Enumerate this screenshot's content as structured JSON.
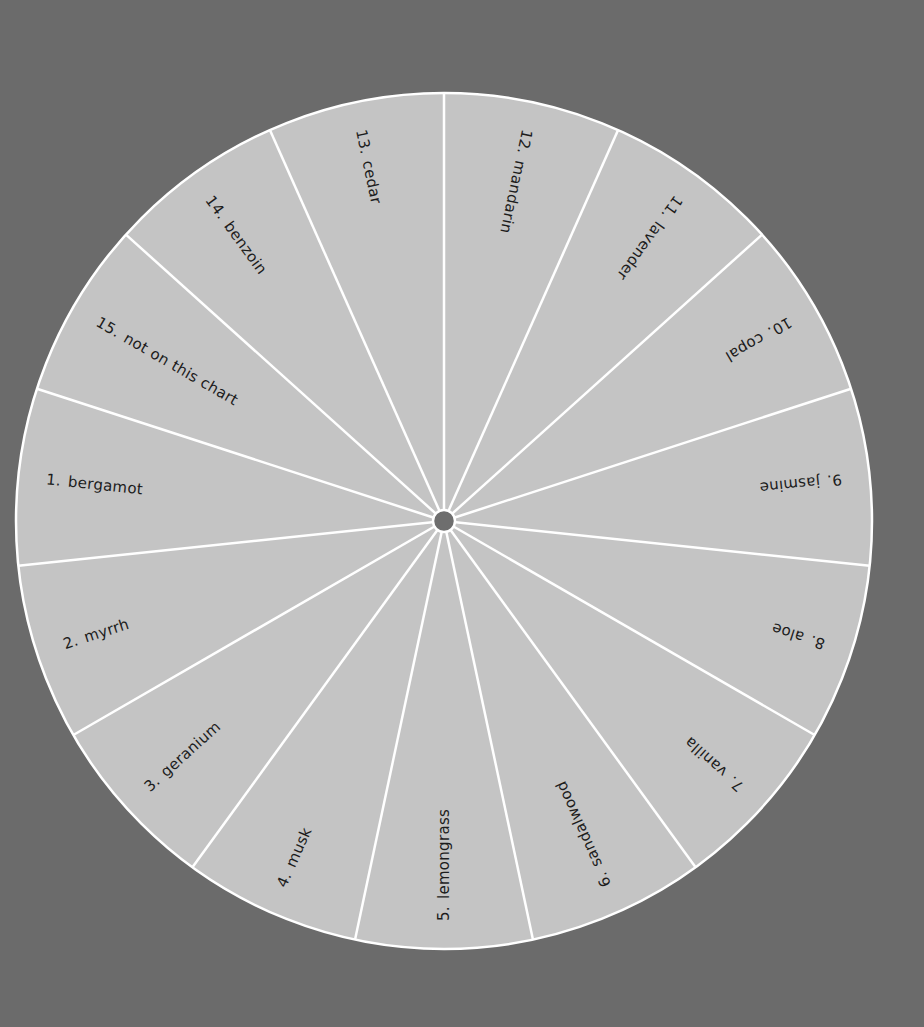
{
  "wheel": {
    "center": [
      444,
      521
    ],
    "radius": 428,
    "hub_radius": 11,
    "start_angle_deg": -90,
    "segment_count": 15,
    "label_radius": 330,
    "colors": {
      "background": "#6b6b6b",
      "wheel_fill": "#c4c4c4",
      "divider": "#ffffff",
      "hub": "#6e6e6e",
      "label_text": "#1c1c1c"
    },
    "segments": [
      {
        "number": "12.",
        "name": "mandarin",
        "center_angle_deg": -78
      },
      {
        "number": "11.",
        "name": "lavender",
        "center_angle_deg": -54
      },
      {
        "number": "10.",
        "name": "copal",
        "center_angle_deg": -30
      },
      {
        "number": "9.",
        "name": "jasmine",
        "center_angle_deg": -6
      },
      {
        "number": "8.",
        "name": "aloe",
        "center_angle_deg": 18
      },
      {
        "number": "7.",
        "name": "vanilla",
        "center_angle_deg": 42
      },
      {
        "number": "6.",
        "name": "sandalwood",
        "center_angle_deg": 66
      },
      {
        "number": "5.",
        "name": "lemongrass",
        "center_angle_deg": 90
      },
      {
        "number": "4.",
        "name": "musk",
        "center_angle_deg": 114
      },
      {
        "number": "3.",
        "name": "geranium",
        "center_angle_deg": 138
      },
      {
        "number": "2.",
        "name": "myrrh",
        "center_angle_deg": 162
      },
      {
        "number": "1.",
        "name": "bergamot",
        "center_angle_deg": 186
      },
      {
        "number": "15.",
        "name": "not on this chart",
        "center_angle_deg": 210
      },
      {
        "number": "14.",
        "name": "benzoin",
        "center_angle_deg": 234
      },
      {
        "number": "13.",
        "name": "cedar",
        "center_angle_deg": 258
      }
    ]
  }
}
